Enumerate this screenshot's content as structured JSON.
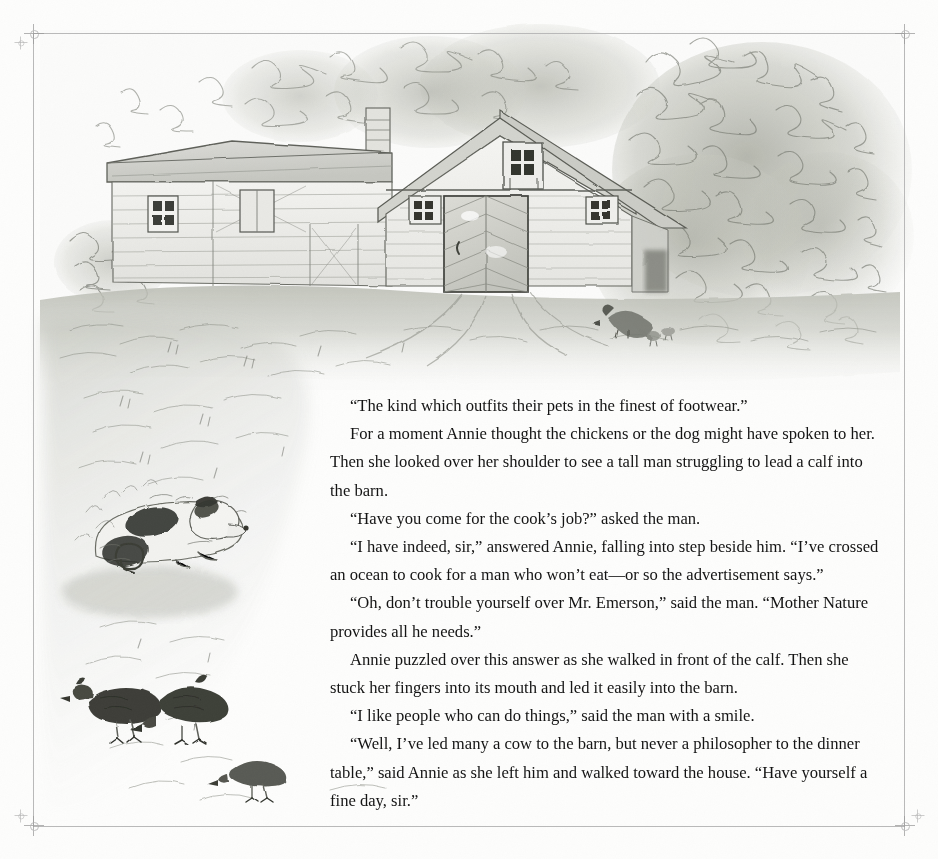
{
  "page": {
    "kind": "illustrated-storybook-page",
    "background_color": "#fdfdfc",
    "trim_box_color": "#b9b9b9",
    "ink_color": "#141414"
  },
  "marks": {
    "registration_label": "registration-mark",
    "trim_label": "trim-line"
  },
  "illustration": {
    "title": "Barn with chickens and dog",
    "medium": "graphite pencil and wash drawing",
    "palette": {
      "paper": "#fbfbfa",
      "light_graphite": "#d7d7d4",
      "mid_graphite": "#b0b1ac",
      "dark_graphite": "#7e8079",
      "deep_ink": "#4a4b46",
      "foliage": "#b6b8ae",
      "ground": "#c9cac3"
    },
    "elements": [
      {
        "name": "farmhouse-wing",
        "description": "clapboard wing at left with two small paned windows"
      },
      {
        "name": "barn-main",
        "description": "gable-end barn with chevron-planked sliding door"
      },
      {
        "name": "barn-loft-window",
        "description": "small paned window in the gable peak"
      },
      {
        "name": "barn-side-windows",
        "description": "two square paned windows flanking the door"
      },
      {
        "name": "chimney",
        "description": "brick chimney on the left roof ridge"
      },
      {
        "name": "tree-canopy",
        "description": "large scribbled deciduous canopy behind and right of the barn"
      },
      {
        "name": "shrubbery-left",
        "description": "low bush against the left wing"
      },
      {
        "name": "ground-grass",
        "description": "swept grass and dirt yard in front of the barn"
      },
      {
        "name": "cart-tracks",
        "description": "wheel ruts leading from the barn door"
      },
      {
        "name": "hen-with-chicks",
        "description": "hen and chicks in the yard right of the door"
      },
      {
        "name": "dog-spotted",
        "description": "black-and-white spotted dog lying in the grass, left margin"
      },
      {
        "name": "chicken-left",
        "description": "chicken pecking, left"
      },
      {
        "name": "chicken-center",
        "description": "chicken pecking, center"
      },
      {
        "name": "chicken-lower",
        "description": "small chicken walking, lower right of the group"
      }
    ]
  },
  "story": {
    "paragraphs": [
      "“The kind which outfits their pets in the finest of footwear.”",
      "For a moment Annie thought the chickens or the dog might have spoken to her. Then she looked over her shoulder to see a tall man struggling to lead a calf into the barn.",
      "“Have you come for the cook’s job?” asked the man.",
      "“I have indeed, sir,” answered Annie, falling into step beside him.  “I’ve crossed an ocean to cook for a man who won’t eat—or so the advertisement says.”",
      "“Oh, don’t trouble yourself over Mr. Emerson,” said the man. “Mother Nature provides all he needs.”",
      "Annie puzzled over this answer as she walked in front of the calf. Then she stuck her fingers into its mouth and led it easily into the barn.",
      "“I like people who can do things,” said the man with a smile.",
      "“Well, I’ve led many a cow to the barn, but never a philosopher to the dinner table,” said Annie as she left him and walked toward the house. “Have yourself a fine day, sir.”"
    ]
  }
}
